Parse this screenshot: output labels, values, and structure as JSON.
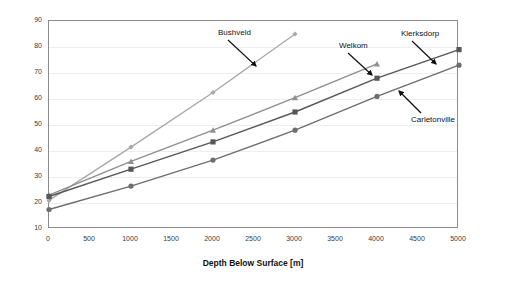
{
  "chart_data": {
    "type": "line",
    "title": "",
    "xlabel": "Depth Below Surface [m]",
    "ylabel": "Temperature [°C]",
    "xlim": [
      0,
      5000
    ],
    "ylim": [
      10,
      90
    ],
    "x_ticks": [
      "0",
      "500",
      "1000",
      "1500",
      "2000",
      "2500",
      "3000",
      "3500",
      "4000",
      "4500",
      "5000"
    ],
    "y_ticks": [
      "10",
      "20",
      "30",
      "40",
      "50",
      "60",
      "70",
      "80",
      "90"
    ],
    "grid": "horizontal",
    "legend_position": "inline-annotations",
    "series": [
      {
        "name": "Bushveld",
        "marker": "diamond",
        "color": "#a9a9a9",
        "x": [
          0,
          1000,
          2000,
          3000
        ],
        "values": [
          21,
          41.5,
          62.5,
          85
        ]
      },
      {
        "name": "Welkom",
        "marker": "triangle",
        "color": "#8f8f8f",
        "x": [
          0,
          1000,
          2000,
          3000,
          4000
        ],
        "values": [
          23,
          36,
          48,
          60.5,
          73.5
        ]
      },
      {
        "name": "Klerksdorp",
        "marker": "square",
        "color": "#575757",
        "x": [
          0,
          1000,
          2000,
          3000,
          4000,
          5000
        ],
        "values": [
          22.5,
          33,
          43.5,
          55,
          68,
          79
        ]
      },
      {
        "name": "Carletonville",
        "marker": "circle",
        "color": "#6e6e6e",
        "x": [
          0,
          1000,
          2000,
          3000,
          4000,
          5000
        ],
        "values": [
          17.5,
          26.5,
          36.5,
          48,
          61,
          73
        ]
      }
    ],
    "annotations": [
      {
        "text": "Bushveld",
        "label_x": 218,
        "label_y": 28,
        "arrow_from": [
          228,
          40
        ],
        "arrow_to": [
          256,
          66
        ]
      },
      {
        "text": "Welkom",
        "label_x": 339,
        "label_y": 41,
        "arrow_from": [
          348,
          53
        ],
        "arrow_to": [
          372,
          75
        ]
      },
      {
        "text": "Klerksdorp",
        "label_x": 401,
        "label_y": 29,
        "arrow_from": [
          412,
          41
        ],
        "arrow_to": [
          436,
          64
        ]
      },
      {
        "text": "Carletonville",
        "label_x": 411,
        "label_y": 115,
        "arrow_from": [
          421,
          113
        ],
        "arrow_to": [
          399,
          91
        ]
      }
    ]
  }
}
